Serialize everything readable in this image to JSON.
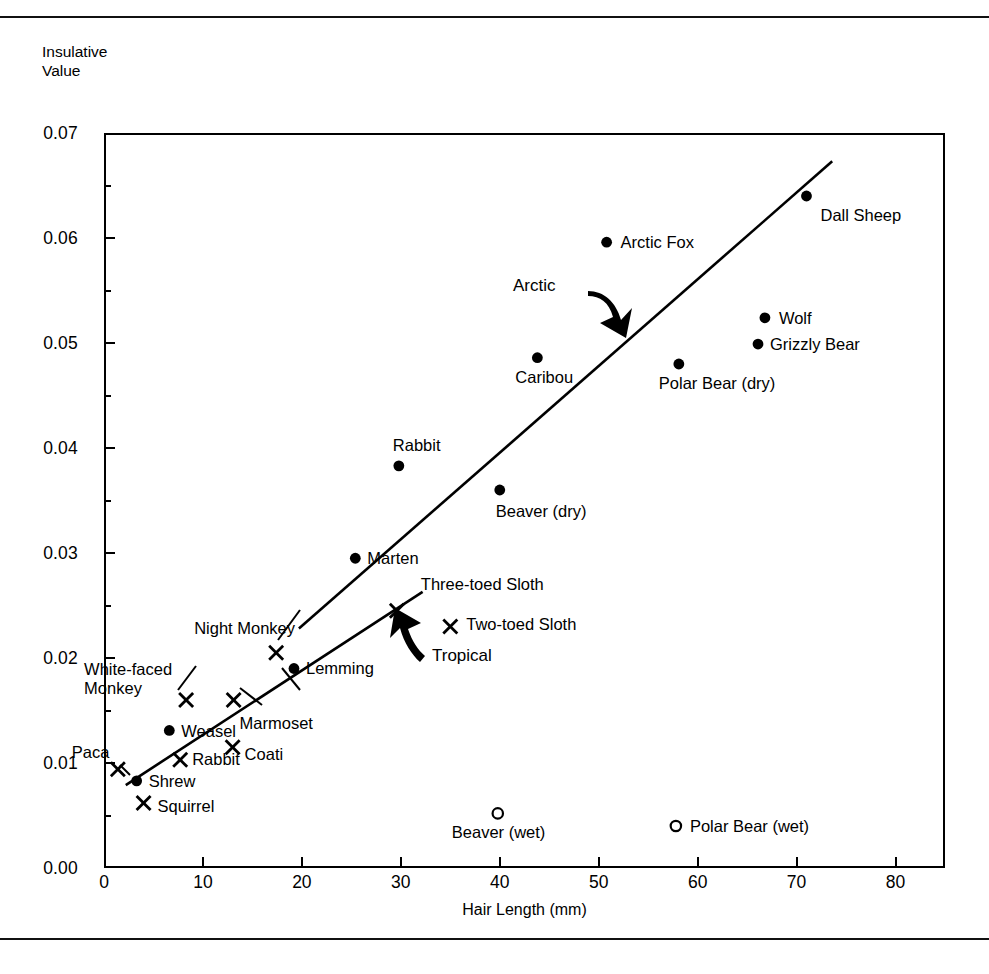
{
  "figure": {
    "y_axis_title": "Insulative\nValue",
    "x_axis_title": "Hair Length (mm)"
  },
  "axes": {
    "y_ticks": [
      "0.07",
      "0.06",
      "0.05",
      "0.04",
      "0.03",
      "0.02",
      "0.01",
      "0.00"
    ],
    "x_ticks": [
      "0",
      "10",
      "20",
      "30",
      "40",
      "50",
      "60",
      "70",
      "80"
    ]
  },
  "annotations": {
    "arctic": "Arctic",
    "tropical": "Tropical"
  },
  "chart_data": {
    "type": "scatter",
    "title": "",
    "xlabel": "Hair Length (mm)",
    "ylabel": "Insulative Value",
    "xlim": [
      0,
      85
    ],
    "ylim": [
      0.0,
      0.07
    ],
    "grid": false,
    "legend": "none",
    "markers": {
      "filled-circle": "Arctic / temperate mammals (dry)",
      "cross": "Tropical mammals",
      "open-circle": "Wet pelt"
    },
    "points": [
      {
        "label": "Dall Sheep",
        "x": 71.0,
        "y": 0.064,
        "marker": "filled-circle",
        "label_pos": "below-right"
      },
      {
        "label": "Arctic Fox",
        "x": 50.8,
        "y": 0.0596,
        "marker": "filled-circle",
        "label_pos": "right"
      },
      {
        "label": "Wolf",
        "x": 66.8,
        "y": 0.0524,
        "marker": "filled-circle",
        "label_pos": "right"
      },
      {
        "label": "Grizzly Bear",
        "x": 66.1,
        "y": 0.0499,
        "marker": "filled-circle",
        "label_pos": "right"
      },
      {
        "label": "Caribou",
        "x": 43.8,
        "y": 0.0486,
        "marker": "filled-circle",
        "label_pos": "below"
      },
      {
        "label": "Polar Bear (dry)",
        "x": 58.1,
        "y": 0.048,
        "marker": "filled-circle",
        "label_pos": "below"
      },
      {
        "label": "Rabbit",
        "x": 29.8,
        "y": 0.0383,
        "marker": "filled-circle",
        "label_pos": "above"
      },
      {
        "label": "Beaver (dry)",
        "x": 40.0,
        "y": 0.036,
        "marker": "filled-circle",
        "label_pos": "below"
      },
      {
        "label": "Marten",
        "x": 25.4,
        "y": 0.0295,
        "marker": "filled-circle",
        "label_pos": "right"
      },
      {
        "label": "Three-toed Sloth",
        "x": 29.6,
        "y": 0.0245,
        "marker": "cross",
        "label_pos": "above-right"
      },
      {
        "label": "Two-toed Sloth",
        "x": 35.0,
        "y": 0.023,
        "marker": "cross",
        "label_pos": "right"
      },
      {
        "label": "Night Monkey",
        "x": 17.4,
        "y": 0.0205,
        "marker": "cross",
        "label_pos": "above-left"
      },
      {
        "label": "Lemming",
        "x": 19.2,
        "y": 0.019,
        "marker": "filled-circle",
        "label_pos": "right"
      },
      {
        "label": "White-faced\nMonkey",
        "x": 8.3,
        "y": 0.016,
        "marker": "cross",
        "label_pos": "above-left"
      },
      {
        "label": "Marmoset",
        "x": 13.1,
        "y": 0.016,
        "marker": "cross",
        "label_pos": "below-right"
      },
      {
        "label": "Weasel",
        "x": 6.6,
        "y": 0.0131,
        "marker": "filled-circle",
        "label_pos": "right"
      },
      {
        "label": "Coati",
        "x": 13.0,
        "y": 0.0115,
        "marker": "cross",
        "label_pos": "right"
      },
      {
        "label": "Rabbit",
        "x": 7.7,
        "y": 0.0103,
        "marker": "cross",
        "label_pos": "right"
      },
      {
        "label": "Paca",
        "x": 1.4,
        "y": 0.0094,
        "marker": "cross",
        "label_pos": "above-right"
      },
      {
        "label": "Shrew",
        "x": 3.3,
        "y": 0.0083,
        "marker": "filled-circle",
        "label_pos": "right"
      },
      {
        "label": "Squirrel",
        "x": 4.0,
        "y": 0.0062,
        "marker": "cross",
        "label_pos": "right"
      },
      {
        "label": "Beaver (wet)",
        "x": 39.8,
        "y": 0.0052,
        "marker": "open-circle",
        "label_pos": "below"
      },
      {
        "label": "Polar Bear (wet)",
        "x": 57.8,
        "y": 0.004,
        "marker": "open-circle",
        "label_pos": "right"
      }
    ],
    "trendlines": [
      {
        "name": "arctic-regression",
        "x0": 19.7,
        "y0": 0.0228,
        "x1": 73.6,
        "y1": 0.0673
      },
      {
        "name": "tropical-regression",
        "x0": 2.2,
        "y0": 0.0079,
        "x1": 32.2,
        "y1": 0.0263
      }
    ]
  }
}
